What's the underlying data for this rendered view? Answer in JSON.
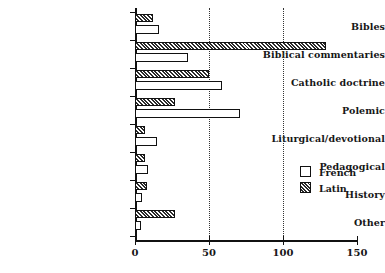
{
  "chart_data": {
    "type": "bar",
    "orientation": "horizontal",
    "title": "",
    "subtitle": "",
    "xlabel": "",
    "ylabel": "",
    "xlim": [
      0,
      150
    ],
    "xticks": [
      0,
      50,
      100,
      150
    ],
    "xtick_labels": [
      "0",
      "50",
      "100",
      "150"
    ],
    "grid": "vertical dotted gridlines at 50 and 100",
    "legend_position": "right-middle",
    "categories": [
      "Bibles",
      "Biblical commentaries",
      "Catholic doctrine",
      "Polemic",
      "Liturgical/devotional",
      "Pedagogical",
      "History",
      "Other"
    ],
    "series": [
      {
        "name": "French",
        "style": "open-white",
        "values": [
          16,
          36,
          59,
          71,
          15,
          9,
          5,
          4
        ]
      },
      {
        "name": "Latin",
        "style": "hatched",
        "values": [
          12,
          129,
          50,
          27,
          7,
          7,
          8,
          27
        ]
      }
    ]
  },
  "axis": {
    "x_tick_labels": [
      "0",
      "50",
      "100",
      "150"
    ]
  },
  "legend": {
    "entries": [
      {
        "label": "French",
        "swatch": "open-square-icon"
      },
      {
        "label": "Latin",
        "swatch": "hatched-square-icon"
      }
    ]
  }
}
